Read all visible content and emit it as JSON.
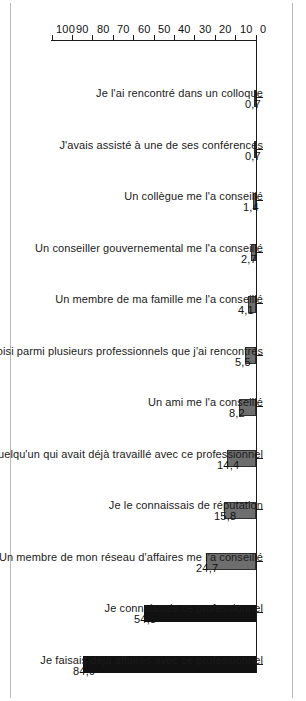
{
  "chart_data": {
    "type": "bar",
    "title": "",
    "xlabel": "",
    "ylabel": "",
    "ylim": [
      0,
      100
    ],
    "grid": false,
    "legend": "none",
    "orientation": "vertical-bars-rotated",
    "decimal_separator": ",",
    "categories": [
      "Je faisais déjà affaires avec ce professionnel",
      "Je connaissais ce professionnel",
      "Un membre de mon réseau d'affaires me l'a conseillé",
      "Je le connaissais de réputation",
      "Je connaissais quelqu'un qui avait déjà travaillé avec ce professionnel",
      "Un ami me l'a conseillé",
      "Je l'ai choisi parmi plusieurs professionnels que j'ai rencontrés",
      "Un membre de ma famille me l'a conseillé",
      "Un conseiller gouvernemental me l'a conseillé",
      "Un collègue me l'a conseillé",
      "J'avais assisté à une de ses conférences",
      "Je l'ai rencontré dans un colloque"
    ],
    "values": [
      84.9,
      54.8,
      24.7,
      15.8,
      14.4,
      8.2,
      5.5,
      4.1,
      2.7,
      1.4,
      0.7,
      0.7
    ],
    "value_labels": [
      "84,9",
      "54,8",
      "24,7",
      "15,8",
      "14,4",
      "8,2",
      "5,5",
      "4,1",
      "2,7",
      "1,4",
      "0,7",
      "0,7"
    ],
    "bar_colors": [
      "#111111",
      "#111111",
      "#6e6e6e",
      "#6e6e6e",
      "#6e6e6e",
      "#6e6e6e",
      "#6e6e6e",
      "#6e6e6e",
      "#6e6e6e",
      "#6e6e6e",
      "#6e6e6e",
      "#6e6e6e"
    ],
    "tick_labels": [
      "0",
      "10",
      "20",
      "30",
      "40",
      "50",
      "60",
      "70",
      "80",
      "90",
      "100"
    ],
    "tick_values": [
      0,
      10,
      20,
      30,
      40,
      50,
      60,
      70,
      80,
      90,
      100
    ]
  }
}
